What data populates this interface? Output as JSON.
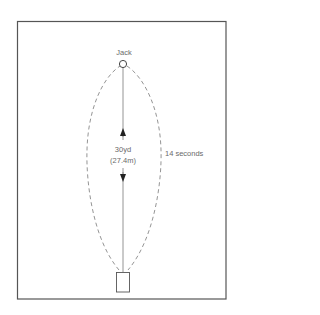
{
  "diagram": {
    "target_label": "Jack",
    "distance_label": "30yd",
    "distance_metric_label": "(27.4m)",
    "time_label": "14 seconds",
    "colors": {
      "frame": "#555555",
      "line": "#777777",
      "dashed_path": "#888888",
      "text": "#6a6a6a",
      "arrow": "#222222"
    }
  }
}
